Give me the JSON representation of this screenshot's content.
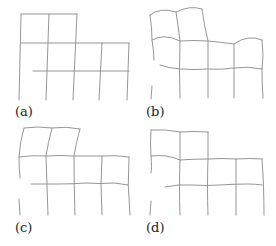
{
  "figure": {
    "panels": [
      {
        "id": "a",
        "label": "(a)",
        "description": "undeformed grid"
      },
      {
        "id": "b",
        "label": "(b)",
        "description": "deformed grid"
      },
      {
        "id": "c",
        "label": "(c)",
        "description": "deformed grid"
      },
      {
        "id": "d",
        "label": "(d)",
        "description": "deformed grid"
      }
    ],
    "line_color": "#8a8a8a"
  }
}
